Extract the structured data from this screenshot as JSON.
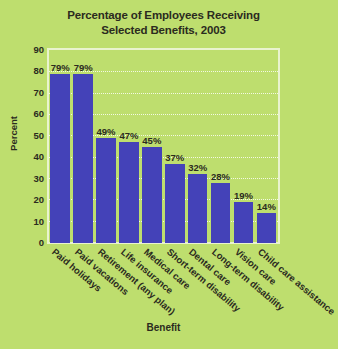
{
  "chart_data": {
    "type": "bar",
    "title": "Percentage of Employees Receiving Selected Benefits, 2003",
    "title_line1": "Percentage of Employees Receiving",
    "title_line2": "Selected Benefits, 2003",
    "xlabel": "Benefit",
    "ylabel": "Percent",
    "ylim": [
      0,
      90
    ],
    "ytick_step": 10,
    "yticks": [
      "90",
      "80",
      "70",
      "60",
      "50",
      "40",
      "30",
      "20",
      "10",
      "0"
    ],
    "ytick_values": [
      90,
      80,
      70,
      60,
      50,
      40,
      30,
      20,
      10,
      0
    ],
    "grid": true,
    "legend": false,
    "categories": [
      "Paid holidays",
      "Paid vacations",
      "Retirement (any plan)",
      "Life insurance",
      "Medical care",
      "Short-term disability",
      "Dental care",
      "Long-term disability",
      "Vision care",
      "Child care assistance"
    ],
    "values": [
      79,
      79,
      49,
      47,
      45,
      37,
      32,
      28,
      19,
      14
    ],
    "value_labels": [
      "79%",
      "79%",
      "49%",
      "47%",
      "45%",
      "37%",
      "32%",
      "28%",
      "19%",
      "14%"
    ],
    "colors": {
      "background": "#bede6e",
      "bar": "#4442b8",
      "text": "#2b2b1e",
      "gridline": "#f2f8e2",
      "plot_border": "#e9f3cf"
    }
  }
}
